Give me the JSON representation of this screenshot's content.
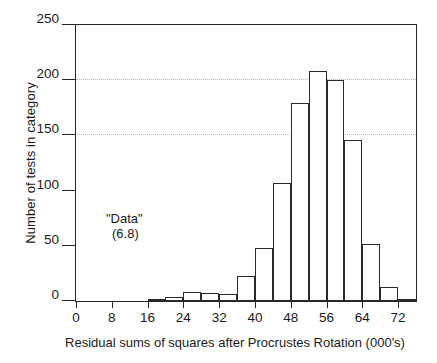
{
  "chart_data": {
    "type": "bar",
    "title": "",
    "subtitle": "",
    "xlabel": "Residual sums of squares after Procrustes Rotation (000's)",
    "ylabel": "Number of tests in category",
    "xlim": [
      0,
      76
    ],
    "ylim": [
      0,
      250
    ],
    "bin_width": 4,
    "grid": true,
    "grid_axis": "y",
    "legend": "none",
    "xticks": [
      0,
      8,
      16,
      24,
      32,
      40,
      48,
      56,
      64,
      72
    ],
    "xtick_labels": [
      "0",
      "8",
      "16",
      "24",
      "32",
      "40",
      "48",
      "56",
      "64",
      "72"
    ],
    "yticks": [
      0,
      50,
      100,
      150,
      200,
      250
    ],
    "ytick_labels": [
      "0",
      "50",
      "100",
      "150",
      "200",
      "250"
    ],
    "bins": [
      {
        "start": 16,
        "end": 20,
        "value": 2
      },
      {
        "start": 20,
        "end": 24,
        "value": 4
      },
      {
        "start": 24,
        "end": 28,
        "value": 8
      },
      {
        "start": 28,
        "end": 32,
        "value": 7
      },
      {
        "start": 32,
        "end": 36,
        "value": 6
      },
      {
        "start": 36,
        "end": 40,
        "value": 23
      },
      {
        "start": 40,
        "end": 44,
        "value": 48
      },
      {
        "start": 44,
        "end": 48,
        "value": 107
      },
      {
        "start": 48,
        "end": 52,
        "value": 179
      },
      {
        "start": 52,
        "end": 56,
        "value": 208
      },
      {
        "start": 56,
        "end": 60,
        "value": 200
      },
      {
        "start": 60,
        "end": 64,
        "value": 146
      },
      {
        "start": 64,
        "end": 68,
        "value": 52
      },
      {
        "start": 68,
        "end": 72,
        "value": 13
      },
      {
        "start": 72,
        "end": 76,
        "value": 2
      }
    ],
    "categories": [
      "16-20",
      "20-24",
      "24-28",
      "28-32",
      "32-36",
      "36-40",
      "40-44",
      "44-48",
      "48-52",
      "52-56",
      "56-60",
      "60-64",
      "64-68",
      "68-72",
      "72-76"
    ],
    "values": [
      2,
      4,
      8,
      7,
      6,
      23,
      48,
      107,
      179,
      208,
      200,
      146,
      52,
      13,
      2
    ],
    "annotations": [
      {
        "line1": "\"Data\"",
        "line2": "(6.8)",
        "x": 12,
        "y": 72
      }
    ],
    "colors": {
      "bar_fill": "#ffffff",
      "bar_edge": "#2a2a2a",
      "axis": "#262626",
      "grid": "#b9b9b9",
      "text": "#1a1a1a",
      "background": "#ffffff"
    }
  }
}
